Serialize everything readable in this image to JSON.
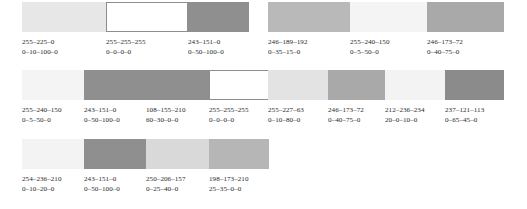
{
  "sheet": {
    "rows": [
      {
        "groups": [
          {
            "name": "row1-group-left",
            "swatches": [
              {
                "rgb": "255–225–0",
                "cmyk": "0–10–100–0",
                "ink": "#e7e7e7",
                "width": 84,
                "label_width": 84,
                "white": false
              },
              {
                "rgb": "255–255–255",
                "cmyk": "0–0–0–0",
                "ink": "#ffffff",
                "width": 82,
                "label_width": 82,
                "white": true
              },
              {
                "rgb": "243–151–0",
                "cmyk": "0–50–100–0",
                "ink": "#8f8f8f",
                "width": 61,
                "label_width": 61,
                "white": false
              }
            ]
          },
          {
            "name": "row1-group-right",
            "swatches": [
              {
                "rgb": "246–189–192",
                "cmyk": "0–35–15–0",
                "ink": "#b9b9b9",
                "width": 82,
                "label_width": 82,
                "white": false
              },
              {
                "rgb": "255–240–150",
                "cmyk": "0–5–50–0",
                "ink": "#f4f4f4",
                "width": 77,
                "label_width": 77,
                "white": false
              },
              {
                "rgb": "246–173–72",
                "cmyk": "0–40–75–0",
                "ink": "#a9a9a9",
                "width": 77,
                "label_width": 77,
                "white": false
              }
            ]
          }
        ]
      },
      {
        "groups": [
          {
            "name": "row2-group-left",
            "swatches": [
              {
                "rgb": "255–240–150",
                "cmyk": "0–5–50–0",
                "ink": "#f4f4f4",
                "width": 62,
                "label_width": 62,
                "white": false
              },
              {
                "rgb": "243–151–0",
                "cmyk": "0–50–100–0",
                "ink": "#8f8f8f",
                "width": 62,
                "label_width": 62,
                "white": false
              },
              {
                "rgb": "108–155–210",
                "cmyk": "60–30–0–0",
                "ink": "#8f8f8f",
                "width": 63,
                "label_width": 63,
                "white": false
              },
              {
                "rgb": "255–255–255",
                "cmyk": "0–0–0–0",
                "ink": "#ffffff",
                "width": 60,
                "label_width": 60,
                "white": true
              }
            ]
          },
          {
            "name": "row2-group-right",
            "swatches": [
              {
                "rgb": "255–227–63",
                "cmyk": "0–10–80–0",
                "ink": "#e3e3e3",
                "width": 60,
                "label_width": 60,
                "white": false
              },
              {
                "rgb": "246–173–72",
                "cmyk": "0–40–75–0",
                "ink": "#a9a9a9",
                "width": 57,
                "label_width": 57,
                "white": false
              },
              {
                "rgb": "212–236–234",
                "cmyk": "20–0–10–0",
                "ink": "#f3f3f3",
                "width": 60,
                "label_width": 60,
                "white": false
              },
              {
                "rgb": "237–121–113",
                "cmyk": "0–65–45–0",
                "ink": "#8b8b8b",
                "width": 59,
                "label_width": 59,
                "white": false
              }
            ]
          }
        ]
      },
      {
        "groups": [
          {
            "name": "row3-group-left",
            "swatches": [
              {
                "rgb": "254–236–210",
                "cmyk": "0–10–20–0",
                "ink": "#f3f3f3",
                "width": 62,
                "label_width": 62,
                "white": false
              },
              {
                "rgb": "243–151–0",
                "cmyk": "0–50–100–0",
                "ink": "#8f8f8f",
                "width": 62,
                "label_width": 62,
                "white": false
              },
              {
                "rgb": "250–206–157",
                "cmyk": "0–25–40–0",
                "ink": "#d9d9d9",
                "width": 63,
                "label_width": 63,
                "white": false
              },
              {
                "rgb": "198–173–210",
                "cmyk": "25–35–0–0",
                "ink": "#b6b6b6",
                "width": 60,
                "label_width": 60,
                "white": false
              }
            ]
          }
        ]
      }
    ]
  }
}
